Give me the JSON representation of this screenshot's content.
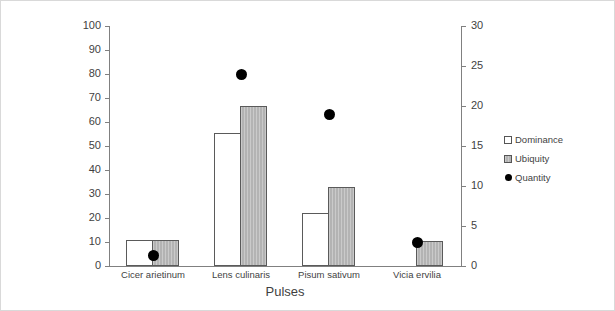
{
  "chart_data": {
    "type": "bar",
    "title": "",
    "xlabel": "Pulses",
    "ylabel": "",
    "y2label": "",
    "categories": [
      "Cicer arietinum",
      "Lens culinaris",
      "Pisum sativum",
      "Vicia ervilia"
    ],
    "series": [
      {
        "name": "Dominance",
        "type": "bar",
        "axis": "left",
        "color": "#ffffff",
        "values": [
          11,
          55.5,
          22,
          null
        ]
      },
      {
        "name": "Ubiquity",
        "type": "bar",
        "axis": "left",
        "color": "#b3b3b3",
        "values": [
          11,
          66.5,
          33,
          10.5
        ]
      },
      {
        "name": "Quantity",
        "type": "scatter",
        "axis": "right",
        "color": "#000000",
        "values": [
          1.3,
          24,
          19,
          3
        ]
      }
    ],
    "ylim": [
      0,
      100
    ],
    "y2lim": [
      0,
      30
    ],
    "yticks": [
      0,
      10,
      20,
      30,
      40,
      50,
      60,
      70,
      80,
      90,
      100
    ],
    "y2ticks": [
      0,
      5,
      10,
      15,
      20,
      25,
      30
    ],
    "grid": false,
    "legend_position": "right"
  },
  "axes": {
    "left_ticks": [
      "0",
      "10",
      "20",
      "30",
      "40",
      "50",
      "60",
      "70",
      "80",
      "90",
      "100"
    ],
    "right_ticks": [
      "0",
      "5",
      "10",
      "15",
      "20",
      "25",
      "30"
    ],
    "x_title": "Pulses",
    "x_categories": [
      "Cicer arietinum",
      "Lens culinaris",
      "Pisum sativum",
      "Vicia ervilia"
    ]
  },
  "legend": {
    "items": [
      {
        "label": "Dominance",
        "marker": "square-white-icon"
      },
      {
        "label": "Ubiquity",
        "marker": "square-gray-icon"
      },
      {
        "label": "Quantity",
        "marker": "circle-black-icon"
      }
    ]
  }
}
